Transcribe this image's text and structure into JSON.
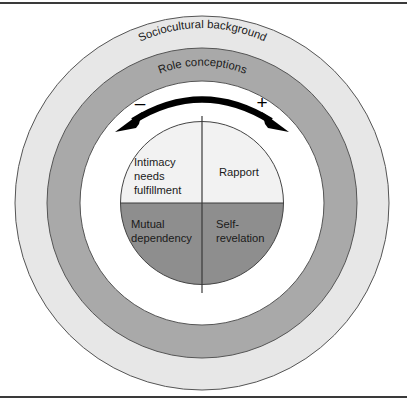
{
  "figure": {
    "rings": [
      {
        "id": "outer",
        "label": "Sociocultural background",
        "color": "#e7e7e7",
        "stroke": "#555555"
      },
      {
        "id": "middle",
        "label": "Role conceptions",
        "color": "#a9a9a9",
        "stroke": "#555555"
      },
      {
        "id": "inner-band",
        "label": "",
        "color": "#ffffff",
        "stroke": "#555555"
      }
    ],
    "core": {
      "stroke": "#444444",
      "quadrants": [
        {
          "id": "top-left",
          "label": "Intimacy needs fulfillment",
          "lines": [
            "Intimacy",
            "needs",
            "fulfillment"
          ],
          "color": "#f2f2f2"
        },
        {
          "id": "top-right",
          "label": "Rapport",
          "lines": [
            "Rapport"
          ],
          "color": "#f2f2f2"
        },
        {
          "id": "bottom-left",
          "label": "Mutual dependency",
          "lines": [
            "Mutual",
            "dependency"
          ],
          "color": "#8e8e8e"
        },
        {
          "id": "bottom-right",
          "label": "Self-revelation",
          "lines": [
            "Self-",
            "revelation"
          ],
          "color": "#8e8e8e"
        }
      ]
    },
    "arrow": {
      "description": "double-headed curved arrow",
      "color": "#000000",
      "left_sign": "–",
      "right_sign": "+"
    }
  }
}
